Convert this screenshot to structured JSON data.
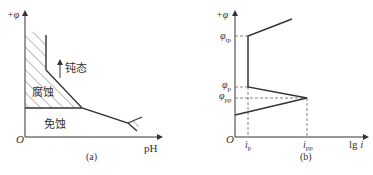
{
  "panel_a": {
    "caption": "(a)",
    "y_axis_label": "+φ",
    "x_axis_label": "pH",
    "origin_label": "O",
    "regions": {
      "corrosion": "腐蚀",
      "passivation": "钝态",
      "immunity": "免蚀"
    }
  },
  "panel_b": {
    "caption": "(b)",
    "y_axis_label": "+φ",
    "x_axis_label": "lg i",
    "x_axis_label_main": "lg ",
    "x_axis_label_var": "i",
    "origin_label": "O",
    "y_ticks": [
      {
        "base": "φ",
        "sub": "tp"
      },
      {
        "base": "φ",
        "sub": "p"
      },
      {
        "base": "φ",
        "sub": "pp"
      }
    ],
    "x_ticks": [
      {
        "base": "i",
        "sub": "p"
      },
      {
        "base": "i",
        "sub": "pp"
      }
    ]
  },
  "colors": {
    "line": "#333333",
    "hatch": "#555555",
    "dashed": "#666666"
  }
}
